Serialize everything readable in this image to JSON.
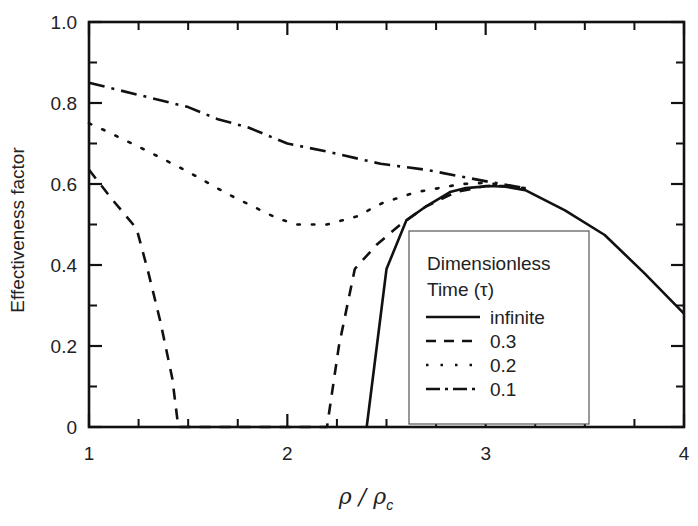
{
  "chart_data": {
    "type": "line",
    "title": "",
    "xlabel": "ρ / ρc",
    "xlabel_parts": {
      "main": "ρ / ρ",
      "subscript": "c"
    },
    "ylabel": "Effectiveness factor",
    "xlim": [
      1,
      4
    ],
    "ylim": [
      0,
      1.0
    ],
    "grid": false,
    "x_ticks": [
      1,
      2,
      3,
      4
    ],
    "x_tick_labels": [
      "1",
      "2",
      "3",
      "4"
    ],
    "x_minor_ticks": [
      1.25,
      1.5,
      1.75,
      2.25,
      2.5,
      2.75,
      3.25,
      3.5,
      3.75
    ],
    "y_ticks": [
      0,
      0.2,
      0.4,
      0.6,
      0.8,
      1.0
    ],
    "y_tick_labels": [
      "0",
      "0.2",
      "0.4",
      "0.6",
      "0.8",
      "1.0"
    ],
    "y_minor_ticks": [
      0.1,
      0.3,
      0.5,
      0.7,
      0.9
    ],
    "legend": {
      "title_line1": "Dimensionless",
      "title_line2": "Time (τ)",
      "position": "lower-center-right",
      "entries": [
        "infinite",
        "0.3",
        "0.2",
        "0.1"
      ]
    },
    "series": [
      {
        "name": "infinite",
        "style": "solid",
        "x": [
          2.4,
          2.5,
          2.6,
          2.7,
          2.82,
          2.9,
          3.02,
          3.1,
          3.2,
          3.4,
          3.6,
          3.8,
          4.0
        ],
        "y": [
          0.0,
          0.39,
          0.51,
          0.545,
          0.58,
          0.59,
          0.595,
          0.593,
          0.585,
          0.535,
          0.474,
          0.38,
          0.28
        ]
      },
      {
        "name": "0.3",
        "style": "dashed",
        "x": [
          1.0,
          1.12,
          1.24,
          1.3,
          1.36,
          1.42,
          1.45,
          2.2,
          2.26,
          2.34,
          2.45,
          2.57,
          2.7,
          2.85,
          3.0,
          3.1
        ],
        "y": [
          0.635,
          0.56,
          0.49,
          0.38,
          0.26,
          0.12,
          0.0,
          0.0,
          0.2,
          0.39,
          0.45,
          0.5,
          0.545,
          0.58,
          0.595,
          0.595
        ]
      },
      {
        "name": "0.2",
        "style": "dotted",
        "x": [
          1.0,
          1.09,
          1.3,
          1.5,
          1.7,
          1.95,
          2.05,
          2.2,
          2.35,
          2.48,
          2.65,
          2.88,
          3.0,
          3.2
        ],
        "y": [
          0.75,
          0.73,
          0.68,
          0.63,
          0.575,
          0.515,
          0.5,
          0.5,
          0.52,
          0.553,
          0.58,
          0.6,
          0.603,
          0.59
        ]
      },
      {
        "name": "0.1",
        "style": "dashdot",
        "x": [
          1.0,
          1.25,
          1.5,
          1.65,
          1.8,
          2.0,
          2.2,
          2.47,
          2.7,
          3.02,
          3.2
        ],
        "y": [
          0.85,
          0.82,
          0.79,
          0.76,
          0.74,
          0.7,
          0.68,
          0.65,
          0.635,
          0.605,
          0.59
        ]
      }
    ]
  }
}
